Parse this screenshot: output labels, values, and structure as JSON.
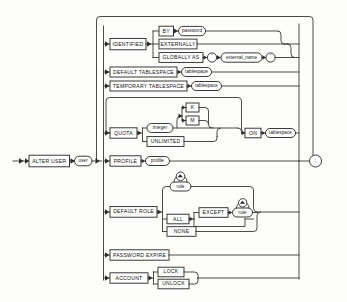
{
  "diagram": {
    "type": "railroad-syntax-diagram",
    "title": "ALTER USER",
    "terminator": ";",
    "start_keyword": "ALTER USER",
    "start_operand": "user",
    "colors": {
      "background": "#fdfdfc",
      "line": "#2b2b2b",
      "box_fill": "#ffffff",
      "text": "#111111"
    },
    "nodes": {
      "alter_user": "ALTER USER",
      "user": "user",
      "identified": "IDENTIFIED",
      "by": "BY",
      "password": "password",
      "externally": "EXTERNALLY",
      "globally_as": "GLOBALLY AS",
      "quote_open": "'",
      "external_name": "external_name",
      "quote_close": "'",
      "default_tablespace": "DEFAULT TABLESPACE",
      "default_tablespace_operand": "tablespace",
      "temporary_tablespace": "TEMPORARY TABLESPACE",
      "temporary_tablespace_operand": "tablespace",
      "quota": "QUOTA",
      "integer": "integer",
      "k": "K",
      "m": "M",
      "unlimited": "UNLIMITED",
      "on": "ON",
      "quota_tablespace": "tablespace",
      "profile": "PROFILE",
      "profile_operand": "profile",
      "default_role": "DEFAULT ROLE",
      "role": "role",
      "role_comma": ",",
      "all": "ALL",
      "except": "EXCEPT",
      "except_role": "role",
      "except_comma": ",",
      "none": "NONE",
      "password_expire": "PASSWORD EXPIRE",
      "account": "ACCOUNT",
      "lock": "LOCK",
      "unlock": "UNLOCK",
      "semicolon": ";"
    },
    "branches": [
      "IDENTIFIED",
      "DEFAULT TABLESPACE",
      "TEMPORARY TABLESPACE",
      "QUOTA",
      "PROFILE",
      "DEFAULT ROLE",
      "PASSWORD EXPIRE",
      "ACCOUNT"
    ]
  }
}
